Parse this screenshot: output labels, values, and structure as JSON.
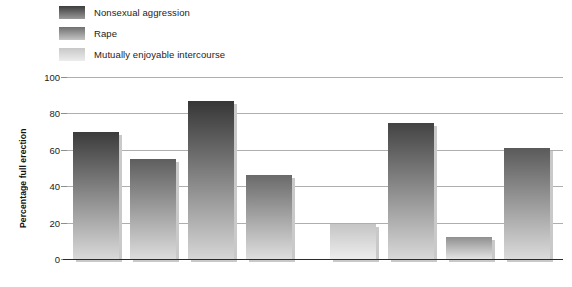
{
  "chart_data": {
    "type": "bar",
    "title": "",
    "xlabel": "",
    "ylabel": "Percentage full erection",
    "ylim": [
      0,
      100
    ],
    "yticks": [
      0,
      20,
      40,
      60,
      80,
      100
    ],
    "ytick_labels": [
      "0",
      "20",
      "40",
      "60",
      "80",
      "100"
    ],
    "grid": true,
    "legend_position": "top-left",
    "categories": [
      "1",
      "2",
      "3",
      "4",
      "5",
      "6",
      "7",
      "8"
    ],
    "series": [
      {
        "name": "Nonsexual aggression",
        "color": "#4a4a4a",
        "values": [
          70,
          null,
          87,
          null,
          null,
          75,
          null,
          null
        ]
      },
      {
        "name": "Rape",
        "color": "#6f6f6f",
        "values": [
          null,
          55,
          null,
          46,
          null,
          null,
          12,
          61
        ]
      },
      {
        "name": "Mutually enjoyable intercourse",
        "color": "#cfcfcf",
        "values": [
          null,
          null,
          null,
          null,
          19,
          null,
          null,
          null
        ]
      }
    ],
    "bars": [
      {
        "index": 0,
        "value": 70,
        "series": "Nonsexual aggression",
        "x": 73,
        "width": 46,
        "top_color": "#3b3b3b",
        "bottom_color": "#d9d9d9"
      },
      {
        "index": 1,
        "value": 55,
        "series": "Rape",
        "x": 130,
        "width": 46,
        "top_color": "#5e5e5e",
        "bottom_color": "#dcdcdc"
      },
      {
        "index": 2,
        "value": 87,
        "series": "Nonsexual aggression",
        "x": 188,
        "width": 46,
        "top_color": "#363636",
        "bottom_color": "#d6d6d6"
      },
      {
        "index": 3,
        "value": 46,
        "series": "Rape",
        "x": 246,
        "width": 46,
        "top_color": "#6a6a6a",
        "bottom_color": "#dedede"
      },
      {
        "index": 4,
        "value": 19,
        "series": "Mutually enjoyable intercourse",
        "x": 330,
        "width": 46,
        "top_color": "#c5c5c5",
        "bottom_color": "#ededed"
      },
      {
        "index": 5,
        "value": 75,
        "series": "Nonsexual aggression",
        "x": 388,
        "width": 46,
        "top_color": "#434343",
        "bottom_color": "#d8d8d8"
      },
      {
        "index": 6,
        "value": 12,
        "series": "Rape",
        "x": 446,
        "width": 46,
        "top_color": "#8f8f8f",
        "bottom_color": "#e4e4e4"
      },
      {
        "index": 7,
        "value": 61,
        "series": "Rape",
        "x": 504,
        "width": 46,
        "top_color": "#5a5a5a",
        "bottom_color": "#dbdbdb"
      }
    ]
  },
  "legend": {
    "items": [
      {
        "label": "Nonsexual aggression",
        "top_color": "#3d3d3d",
        "bottom_color": "#9a9a9a"
      },
      {
        "label": "Rape",
        "top_color": "#707070",
        "bottom_color": "#c4c4c4"
      },
      {
        "label": "Mutually enjoyable intercourse",
        "top_color": "#c8c8c8",
        "bottom_color": "#ececec"
      }
    ]
  },
  "caption": {
    "text": ""
  }
}
